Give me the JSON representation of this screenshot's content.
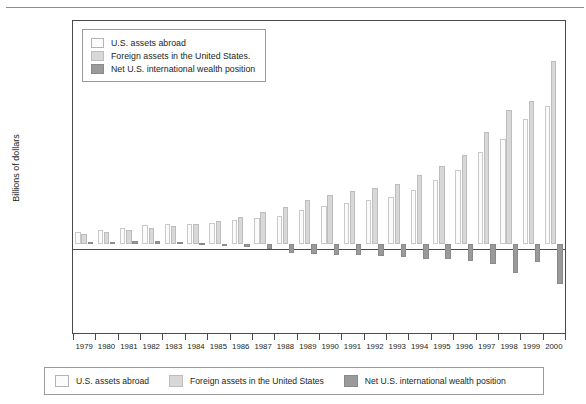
{
  "chart_data": {
    "type": "bar",
    "title": "",
    "xlabel": "",
    "ylabel": "Billions of dollars",
    "ylim": [
      -4000,
      10000
    ],
    "ytick_values": [
      10000,
      8000,
      6000,
      4000,
      2000,
      0,
      -2000,
      -4000
    ],
    "ytick_labels": [
      "10,000",
      "8,000",
      "6,000",
      "4,000",
      "2,000",
      "0",
      "(2,000)",
      "(4,000)"
    ],
    "grid": false,
    "legend_position": "upper-left-inside",
    "categories": [
      "1979",
      "1980",
      "1981",
      "1982",
      "1983",
      "1984",
      "1985",
      "1986",
      "1987",
      "1988",
      "1989",
      "1990",
      "1991",
      "1992",
      "1993",
      "1994",
      "1995",
      "1996",
      "1997",
      "1998",
      "1999",
      "2000"
    ],
    "series": [
      {
        "name": "U.S. assets abroad",
        "color": "#fbfbfb",
        "values": [
          510,
          610,
          720,
          840,
          890,
          900,
          950,
          1070,
          1170,
          1270,
          1500,
          1700,
          1850,
          1950,
          2100,
          2400,
          2850,
          3300,
          4100,
          4700,
          5600,
          6200
        ]
      },
      {
        "name": "Foreign assets in the United States.",
        "color": "#d8d8d8",
        "values": [
          420,
          520,
          620,
          720,
          800,
          880,
          1020,
          1190,
          1450,
          1650,
          1950,
          2200,
          2350,
          2500,
          2700,
          3100,
          3500,
          4000,
          5000,
          6000,
          6400,
          8200
        ]
      },
      {
        "name": "Net U.S. international wealth position",
        "color": "#9a9a9a",
        "values": [
          95,
          105,
          140,
          140,
          90,
          25,
          -110,
          -160,
          -250,
          -400,
          -450,
          -500,
          -500,
          -550,
          -600,
          -700,
          -700,
          -750,
          -900,
          -1300,
          -800,
          -1800
        ]
      }
    ]
  },
  "inner_legend": {
    "items": [
      {
        "label": "U.S. assets abroad",
        "swatch": "assets"
      },
      {
        "label": "Foreign assets in the United States.",
        "swatch": "foreign"
      },
      {
        "label": "Net U.S. international wealth position",
        "swatch": "net"
      }
    ]
  },
  "bottom_legend": {
    "items": [
      {
        "label": "U.S. assets abroad",
        "swatch": "assets"
      },
      {
        "label": "Foreign assets in the United States",
        "swatch": "foreign"
      },
      {
        "label": "Net U.S. international wealth position",
        "swatch": "net"
      }
    ]
  }
}
